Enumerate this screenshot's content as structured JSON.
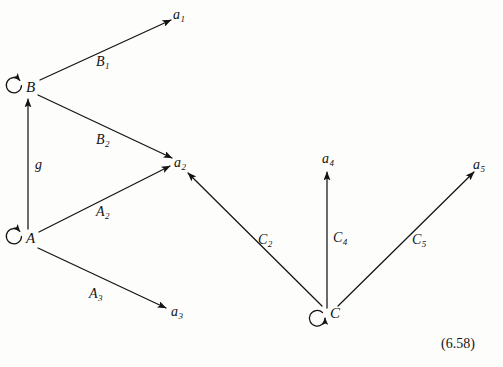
{
  "figure": {
    "equation_number": "(6.58)",
    "background_color": "#fdfdfc",
    "ink_color": "#141414",
    "width": 503,
    "height": 367
  },
  "nodes": [
    {
      "id": "B",
      "label": "B",
      "x": 28,
      "y": 87,
      "self_loop": true,
      "loop_position": "upper-left"
    },
    {
      "id": "A",
      "label": "A",
      "x": 28,
      "y": 238,
      "self_loop": true,
      "loop_position": "upper-left"
    },
    {
      "id": "C",
      "label": "C",
      "x": 330,
      "y": 314,
      "self_loop": true,
      "loop_position": "lower-left"
    },
    {
      "id": "a1",
      "label": "a",
      "sub": "1",
      "x": 177,
      "y": 15,
      "self_loop": false
    },
    {
      "id": "a2",
      "label": "a",
      "sub": "2",
      "x": 180,
      "y": 163,
      "self_loop": false
    },
    {
      "id": "a3",
      "label": "a",
      "sub": "3",
      "x": 177,
      "y": 312,
      "self_loop": false
    },
    {
      "id": "a4",
      "label": "a",
      "sub": "4",
      "x": 330,
      "y": 160,
      "self_loop": false
    },
    {
      "id": "a5",
      "label": "a",
      "sub": "5",
      "x": 480,
      "y": 166,
      "self_loop": false
    }
  ],
  "edges": [
    {
      "id": "e-B-a1",
      "from": "B",
      "to": "a1",
      "label": "B",
      "sub": "1",
      "label_x": 98,
      "label_y": 62
    },
    {
      "id": "e-B-a2",
      "from": "B",
      "to": "a2",
      "label": "B",
      "sub": "2",
      "label_x": 98,
      "label_y": 140
    },
    {
      "id": "e-A-B",
      "from": "A",
      "to": "B",
      "label": "g",
      "sub": "",
      "label_x": 36,
      "label_y": 165
    },
    {
      "id": "e-A-a2",
      "from": "A",
      "to": "a2",
      "label": "A",
      "sub": "2",
      "label_x": 98,
      "label_y": 212
    },
    {
      "id": "e-A-a3",
      "from": "A",
      "to": "a3",
      "label": "A",
      "sub": "3",
      "label_x": 91,
      "label_y": 294
    },
    {
      "id": "e-C-a2",
      "from": "C",
      "to": "a2",
      "label": "C",
      "sub": "2",
      "label_x": 260,
      "label_y": 240
    },
    {
      "id": "e-C-a4",
      "from": "C",
      "to": "a4",
      "label": "C",
      "sub": "4",
      "label_x": 335,
      "label_y": 238
    },
    {
      "id": "e-C-a5",
      "from": "C",
      "to": "a5",
      "label": "C",
      "sub": "5",
      "label_x": 414,
      "label_y": 240
    }
  ]
}
